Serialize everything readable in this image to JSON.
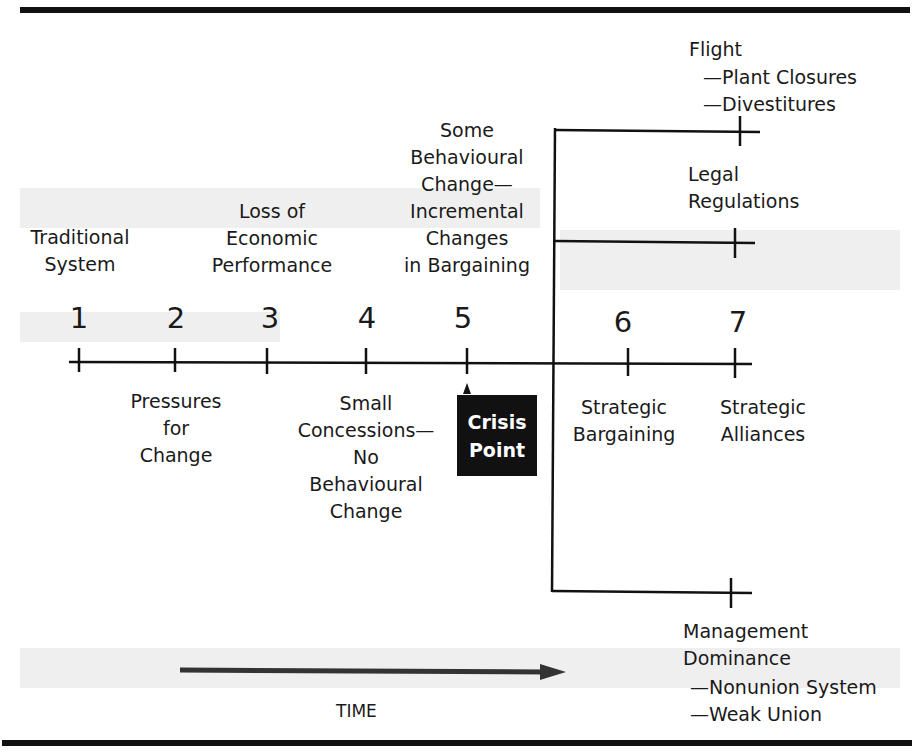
{
  "diagram": {
    "axis_label": "TIME",
    "stages": [
      {
        "number": "1",
        "label_above": "Traditional\nSystem",
        "label_below": ""
      },
      {
        "number": "2",
        "label_above": "",
        "label_below": "Pressures\nfor\nChange"
      },
      {
        "number": "3",
        "label_above": "Loss of\nEconomic\nPerformance",
        "label_below": ""
      },
      {
        "number": "4",
        "label_above": "",
        "label_below": "Small\nConcessions—\nNo\nBehavioural\nChange"
      },
      {
        "number": "5",
        "label_above": "Some\nBehavioural\nChange—\nIncremental\nChanges\nin Bargaining",
        "label_below": ""
      },
      {
        "number": "6",
        "label_above": "",
        "label_below": "Strategic\nBargaining"
      },
      {
        "number": "7",
        "label_above": "",
        "label_below": "Strategic\nAlliances"
      }
    ],
    "crisis_point": {
      "line1": "Crisis",
      "line2": "Point"
    },
    "branches": [
      {
        "title": "Flight",
        "subitems": [
          "—Plant Closures",
          "—Divestitures"
        ]
      },
      {
        "title": "Legal\nRegulations",
        "subitems": []
      },
      {
        "title": "Management\nDominance",
        "subitems": [
          "—Nonunion System",
          "—Weak Union"
        ]
      }
    ],
    "colors": {
      "ink": "#111111",
      "background": "#ffffff",
      "crisis_box": "#111111",
      "crisis_text": "#ffffff"
    }
  }
}
